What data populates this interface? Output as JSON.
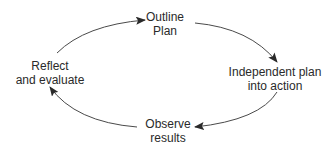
{
  "diagram": {
    "type": "cycle",
    "colors": {
      "stroke": "#4a4a4a",
      "text": "#2a2a2a",
      "background": "#ffffff"
    },
    "nodes": [
      {
        "id": "outline",
        "lines": [
          "Outline",
          "Plan"
        ]
      },
      {
        "id": "implement",
        "lines": [
          "Independent plan",
          "into action"
        ]
      },
      {
        "id": "observe",
        "lines": [
          "Observe",
          "results"
        ]
      },
      {
        "id": "reflect",
        "lines": [
          "Reflect",
          "and evaluate"
        ]
      }
    ],
    "edges": [
      {
        "from": "reflect",
        "to": "outline"
      },
      {
        "from": "outline",
        "to": "implement"
      },
      {
        "from": "implement",
        "to": "observe"
      },
      {
        "from": "observe",
        "to": "reflect"
      }
    ]
  }
}
